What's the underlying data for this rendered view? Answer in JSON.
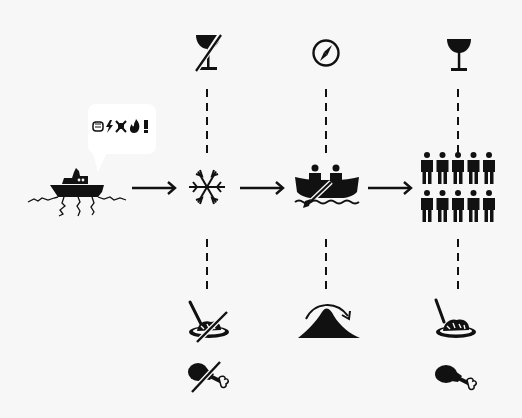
{
  "diagram": {
    "title": "",
    "start": {
      "icon": "ship-stuck-in-ice-icon",
      "speech_bubble": {
        "icon": "speech-bubble-icon",
        "text": "grawlix: fist, lightning, skull, fire, exclamation",
        "visible_glyphs": "👊⚡☠🔥!"
      }
    },
    "flow": [
      {
        "id": "frozen",
        "main_icon": "snowflake-icon",
        "top_icon": "no-drink-icon",
        "top_meaning": "no drink",
        "bottom_icons": [
          {
            "icon": "no-food-plate-icon",
            "meaning": "no food"
          },
          {
            "icon": "no-meat-icon",
            "meaning": "no meat"
          }
        ]
      },
      {
        "id": "rowboat",
        "main_icon": "rowboat-with-two-people-icon",
        "top_icon": "compass-icon",
        "top_meaning": "navigation",
        "bottom_icons": [
          {
            "icon": "over-mountain-icon",
            "meaning": "crossing over mountain"
          }
        ]
      },
      {
        "id": "crowd",
        "main_icon": "group-of-ten-people-icon",
        "people_count": 10,
        "top_icon": "drink-glass-icon",
        "top_meaning": "drink",
        "bottom_icons": [
          {
            "icon": "food-plate-icon",
            "meaning": "food"
          },
          {
            "icon": "meat-drumstick-icon",
            "meaning": "meat"
          }
        ]
      }
    ],
    "arrows": [
      "arrow-right-icon",
      "arrow-right-icon",
      "arrow-right-icon"
    ],
    "colors": {
      "background": "#f7f7f7",
      "ink": "#111111",
      "bubble": "#ffffff"
    }
  }
}
